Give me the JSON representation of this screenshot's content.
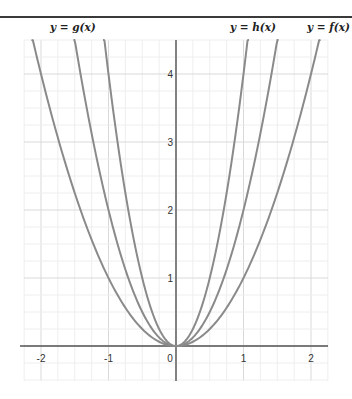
{
  "chart_data": {
    "type": "line",
    "title": "",
    "xlabel": "",
    "ylabel": "",
    "xlim": [
      -2.25,
      2.25
    ],
    "ylim": [
      -0.5,
      4.5
    ],
    "grid": true,
    "x_ticks": [
      "-2",
      "-1",
      "0",
      "1",
      "2"
    ],
    "y_ticks": [
      "1",
      "2",
      "3",
      "4"
    ],
    "series": [
      {
        "name": "y = f(x)",
        "expr": "x^2",
        "coef": 1
      },
      {
        "name": "y = h(x)",
        "expr": "2x^2",
        "coef": 2
      },
      {
        "name": "y = g(x)",
        "expr": "4x^2",
        "coef": 4
      }
    ],
    "annotations": [
      {
        "text": "y = g(x)",
        "position": "top-left"
      },
      {
        "text": "y = h(x)",
        "position": "top-right-inner"
      },
      {
        "text": "y = f(x)",
        "position": "top-right-outer"
      }
    ],
    "colors": {
      "curve": "#8a8a8a",
      "axis": "#555555",
      "grid_major": "#d9d9d9",
      "grid_minor": "#eeeeee"
    }
  },
  "labels": {
    "g": "y = g(x)",
    "h": "y = h(x)",
    "f": "y = f(x)"
  },
  "ticks": {
    "x": [
      {
        "v": -2,
        "t": "-2"
      },
      {
        "v": -1,
        "t": "-1"
      },
      {
        "v": 0,
        "t": "0"
      },
      {
        "v": 1,
        "t": "1"
      },
      {
        "v": 2,
        "t": "2"
      }
    ],
    "y": [
      {
        "v": 1,
        "t": "1"
      },
      {
        "v": 2,
        "t": "2"
      },
      {
        "v": 3,
        "t": "3"
      },
      {
        "v": 4,
        "t": "4"
      }
    ]
  }
}
